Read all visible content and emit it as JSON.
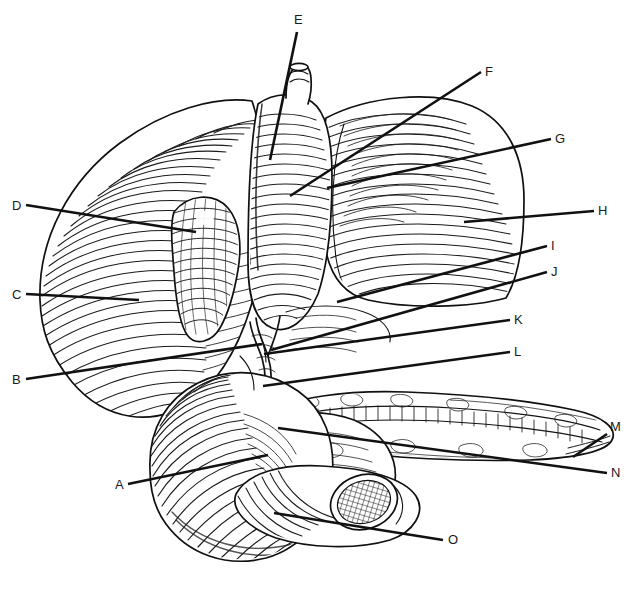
{
  "figure": {
    "style": "black-and-white engraved line art with hatching",
    "background_color": "#ffffff",
    "ink_color": "#111111",
    "width": 635,
    "height": 590
  },
  "labels": [
    {
      "id": "A",
      "text": "A",
      "x": 115,
      "y": 489,
      "line": {
        "x1": 128,
        "y1": 484,
        "x2": 268,
        "y2": 455
      }
    },
    {
      "id": "B",
      "text": "B",
      "x": 12,
      "y": 384,
      "line": {
        "x1": 26,
        "y1": 379,
        "x2": 262,
        "y2": 344
      }
    },
    {
      "id": "C",
      "text": "C",
      "x": 12,
      "y": 299,
      "line": {
        "x1": 26,
        "y1": 294,
        "x2": 139,
        "y2": 300
      }
    },
    {
      "id": "D",
      "text": "D",
      "x": 12,
      "y": 210,
      "line": {
        "x1": 26,
        "y1": 205,
        "x2": 196,
        "y2": 232
      }
    },
    {
      "id": "E",
      "text": "E",
      "x": 294,
      "y": 24,
      "line": {
        "x1": 297,
        "y1": 32,
        "x2": 270,
        "y2": 160
      }
    },
    {
      "id": "F",
      "text": "F",
      "x": 485,
      "y": 76,
      "line": {
        "x1": 481,
        "y1": 72,
        "x2": 290,
        "y2": 196
      }
    },
    {
      "id": "G",
      "text": "G",
      "x": 555,
      "y": 143,
      "line": {
        "x1": 551,
        "y1": 139,
        "x2": 327,
        "y2": 188
      }
    },
    {
      "id": "H",
      "text": "H",
      "x": 598,
      "y": 215,
      "line": {
        "x1": 594,
        "y1": 211,
        "x2": 464,
        "y2": 222
      }
    },
    {
      "id": "I",
      "text": "I",
      "x": 551,
      "y": 250,
      "line": {
        "x1": 547,
        "y1": 246,
        "x2": 337,
        "y2": 302
      }
    },
    {
      "id": "J",
      "text": "J",
      "x": 551,
      "y": 276,
      "line": {
        "x1": 547,
        "y1": 272,
        "x2": 271,
        "y2": 350
      }
    },
    {
      "id": "K",
      "text": "K",
      "x": 514,
      "y": 324,
      "line": {
        "x1": 510,
        "y1": 320,
        "x2": 264,
        "y2": 354
      }
    },
    {
      "id": "L",
      "text": "L",
      "x": 514,
      "y": 356,
      "line": {
        "x1": 510,
        "y1": 352,
        "x2": 263,
        "y2": 386
      }
    },
    {
      "id": "M",
      "text": "M",
      "x": 610,
      "y": 431,
      "line": {
        "x1": 607,
        "y1": 434,
        "x2": 573,
        "y2": 457
      }
    },
    {
      "id": "N",
      "text": "N",
      "x": 611,
      "y": 477,
      "line": {
        "x1": 607,
        "y1": 473,
        "x2": 278,
        "y2": 428
      }
    },
    {
      "id": "O",
      "text": "O",
      "x": 448,
      "y": 544,
      "line": {
        "x1": 443,
        "y1": 540,
        "x2": 274,
        "y2": 513
      }
    }
  ],
  "leader_style": {
    "stroke_color": "#111111",
    "stroke_width": 2.6,
    "label_font_size": 13
  },
  "structures": [
    {
      "name": "left-lobe-of-liver",
      "note": "large hatched mass at left"
    },
    {
      "name": "right-lobe-of-liver",
      "note": "large hatched mass at right"
    },
    {
      "name": "gallbladder",
      "note": "pear shaped body lower-left of center"
    },
    {
      "name": "esophagus",
      "note": "tube entering at top center"
    },
    {
      "name": "stomach",
      "note": "central body behind liver lobes"
    },
    {
      "name": "pancreas",
      "note": "elongated lobulated gland with duct, center-right"
    },
    {
      "name": "duodenum",
      "note": "C-shaped loop below the liver"
    },
    {
      "name": "bile-duct-junction",
      "note": "Y-shaped ducts at porta hepatis"
    },
    {
      "name": "transverse-colon-cut-end",
      "note": "cut tube with cross-hatched lumen, lower center"
    }
  ]
}
